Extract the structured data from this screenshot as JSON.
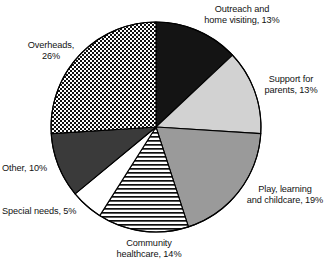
{
  "chart_data": {
    "type": "pie",
    "title": "",
    "subtitle": "",
    "xlabel": "",
    "ylabel": "",
    "legend_position": "none",
    "grid": false,
    "labels_show_percent": true,
    "start_angle_deg": 0,
    "direction": "clockwise",
    "categories": [
      "Outreach and home visiting",
      "Support for parents",
      "Play, learning and childcare",
      "Community healthcare",
      "Special needs",
      "Other",
      "Overheads"
    ],
    "values": [
      13,
      13,
      19,
      14,
      5,
      10,
      26
    ],
    "unit": "%",
    "total": 100,
    "slices": [
      {
        "key": "outreach",
        "label": "Outreach and\nhome visiting, 13%",
        "name": "Outreach and home visiting",
        "value": 13,
        "fill_style": "solid",
        "color": "#141414",
        "start_deg": 0,
        "end_deg": 46.8
      },
      {
        "key": "support",
        "label": "Support for\nparents, 13%",
        "name": "Support for parents",
        "value": 13,
        "fill_style": "solid",
        "color": "#d2d2d2",
        "start_deg": 46.8,
        "end_deg": 93.6
      },
      {
        "key": "play",
        "label": "Play, learning\nand childcare, 19%",
        "name": "Play, learning and childcare",
        "value": 19,
        "fill_style": "solid",
        "color": "#9a9a9a",
        "start_deg": 93.6,
        "end_deg": 162.0
      },
      {
        "key": "community",
        "label": "Community\nhealthcare, 14%",
        "name": "Community healthcare",
        "value": 14,
        "fill_style": "horizontal-stripes",
        "color": "#ffffff",
        "start_deg": 162.0,
        "end_deg": 212.4
      },
      {
        "key": "special",
        "label": "Special needs, 5%",
        "name": "Special needs",
        "value": 5,
        "fill_style": "solid",
        "color": "#ffffff",
        "start_deg": 212.4,
        "end_deg": 230.4
      },
      {
        "key": "other",
        "label": "Other, 10%",
        "name": "Other",
        "value": 10,
        "fill_style": "solid",
        "color": "#3a3a3a",
        "start_deg": 230.4,
        "end_deg": 266.4
      },
      {
        "key": "overheads",
        "label": "Overheads,\n26%",
        "name": "Overheads",
        "value": 26,
        "fill_style": "checkerboard",
        "color": "#ffffff",
        "start_deg": 266.4,
        "end_deg": 360.0
      }
    ],
    "geometry": {
      "center_x": 156,
      "center_y": 127,
      "radius": 105
    },
    "colors": {
      "outline": "#000000",
      "background": "#ffffff",
      "text": "#121212"
    }
  }
}
